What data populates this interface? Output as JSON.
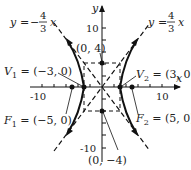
{
  "diagram": {
    "type": "hyperbola",
    "equation_form": "x^2/9 - y^2/16 = 1",
    "axes": {
      "x_label": "x",
      "y_label": "y",
      "x_ticks": [
        "-10",
        "10"
      ],
      "y_ticks": [
        "10",
        "-10"
      ]
    },
    "asymptotes": [
      {
        "label_y": "y",
        "label_eq": "=",
        "label_sign": "−",
        "num": "4",
        "den": "3",
        "label_x": "x",
        "slope": -1.3333
      },
      {
        "label_y": "y",
        "label_eq": "=",
        "label_sign": "",
        "num": "4",
        "den": "3",
        "label_x": "x",
        "slope": 1.3333
      }
    ],
    "points": {
      "v1": {
        "name": "V",
        "sub": "1",
        "text": " = (−3, 0)",
        "x": -3,
        "y": 0
      },
      "v2": {
        "name": "V",
        "sub": "2",
        "text": " = (3, 0)",
        "x": 3,
        "y": 0
      },
      "f1": {
        "name": "F",
        "sub": "1",
        "text": " = (−5, 0)",
        "x": -5,
        "y": 0
      },
      "f2": {
        "name": "F",
        "sub": "2",
        "text": " = (5, 0)",
        "x": 5,
        "y": 0
      },
      "top": {
        "text": "(0, 4)",
        "x": 0,
        "y": 4
      },
      "bottom": {
        "text": "(0, −4)",
        "x": 0,
        "y": -4
      }
    }
  }
}
